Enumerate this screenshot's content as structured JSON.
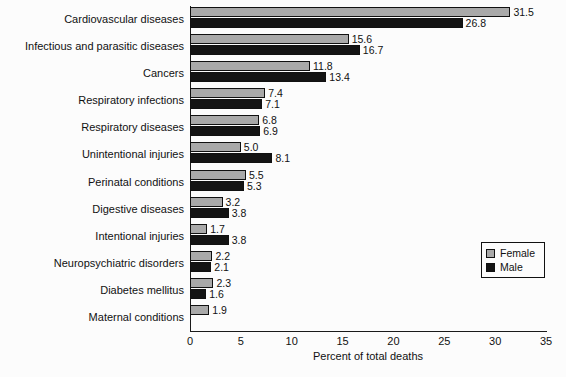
{
  "chart_data": {
    "type": "bar",
    "orientation": "horizontal",
    "title": "",
    "xlabel": "Percent of total deaths",
    "ylabel": "",
    "xlim": [
      0,
      35
    ],
    "xticks": [
      "0",
      "5",
      "10",
      "15",
      "20",
      "25",
      "30",
      "35"
    ],
    "grid": false,
    "legend_position": "center-right",
    "categories": [
      "Cardiovascular diseases",
      "Infectious and parasitic diseases",
      "Cancers",
      "Respiratory infections",
      "Respiratory diseases",
      "Unintentional injuries",
      "Perinatal conditions",
      "Digestive diseases",
      "Intentional injuries",
      "Neuropsychiatric disorders",
      "Diabetes mellitus",
      "Maternal conditions"
    ],
    "series": [
      {
        "name": "Female",
        "color": "#a9a9a9",
        "values": [
          31.5,
          15.6,
          11.8,
          7.4,
          6.8,
          5.0,
          5.5,
          3.2,
          1.7,
          2.2,
          2.3,
          1.9
        ],
        "labels": [
          "31.5",
          "15.6",
          "11.8",
          "7.4",
          "6.8",
          "5.0",
          "5.5",
          "3.2",
          "1.7",
          "2.2",
          "2.3",
          "1.9"
        ]
      },
      {
        "name": "Male",
        "color": "#141414",
        "values": [
          26.8,
          16.7,
          13.4,
          7.1,
          6.9,
          8.1,
          5.3,
          3.8,
          3.8,
          2.1,
          1.6,
          null
        ],
        "labels": [
          "26.8",
          "16.7",
          "13.4",
          "7.1",
          "6.9",
          "8.1",
          "5.3",
          "3.8",
          "3.8",
          "2.1",
          "1.6",
          ""
        ]
      }
    ]
  },
  "legend": {
    "items": [
      {
        "label": "Female",
        "color": "#a9a9a9"
      },
      {
        "label": "Male",
        "color": "#141414"
      }
    ]
  }
}
